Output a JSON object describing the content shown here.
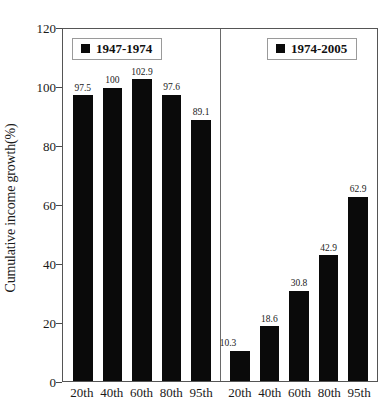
{
  "chart_data": {
    "type": "bar",
    "title": "",
    "xlabel": "",
    "ylabel": "Cumulative income growth(%)",
    "ylim": [
      0,
      120
    ],
    "yticks": [
      0,
      20,
      40,
      60,
      80,
      100,
      120
    ],
    "ytick_labels": [
      "0",
      "20",
      "40",
      "60",
      "80",
      "100",
      "120"
    ],
    "grid": false,
    "legend_position": "inside-top",
    "categories": [
      "20th",
      "40th",
      "60th",
      "80th",
      "95th"
    ],
    "series": [
      {
        "name": "1947-1974",
        "color": "#0a0a0a",
        "values": [
          97.5,
          100,
          102.9,
          97.6,
          89.1
        ],
        "value_labels": [
          "97.5",
          "100",
          "102.9",
          "97.6",
          "89.1"
        ]
      },
      {
        "name": "1974-2005",
        "color": "#0a0a0a",
        "values": [
          10.3,
          18.6,
          30.8,
          42.9,
          62.9
        ],
        "value_labels": [
          "10.3",
          "18.6",
          "30.8",
          "42.9",
          "62.9"
        ]
      }
    ]
  },
  "legend": {
    "left": {
      "label": "1947-1974"
    },
    "right": {
      "label": "1974-2005"
    }
  },
  "axes": {
    "y": {
      "label": "Cumulative income growth(%)",
      "ticks": [
        "120",
        "100",
        "80",
        "60",
        "40",
        "20",
        "0"
      ]
    },
    "x": {
      "group_left": [
        "20th",
        "40th",
        "60th",
        "80th",
        "95th"
      ],
      "group_right": [
        "20th",
        "40th",
        "60th",
        "80th",
        "95th"
      ]
    }
  }
}
